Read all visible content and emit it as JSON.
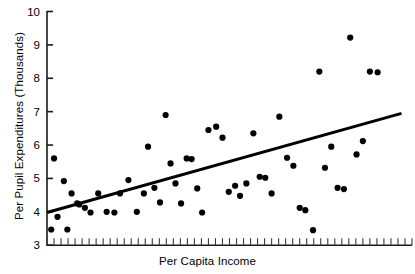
{
  "chart_data": {
    "type": "scatter",
    "title": "",
    "xlabel": "Per Capita Income",
    "ylabel": "Per Pupil Expenditures (Thousands)",
    "ylim": [
      3,
      10
    ],
    "yticks": [
      3,
      4,
      5,
      6,
      7,
      8,
      9,
      10
    ],
    "ytick_labels": [
      "3",
      "4",
      "5",
      "6",
      "7",
      "8",
      "9",
      "10"
    ],
    "xlim": [
      0,
      52
    ],
    "xticks_count": 52,
    "xtick_labels": [],
    "grid": false,
    "legend": null,
    "marker": "filled-circle",
    "marker_color": "#000000",
    "marker_size_px": 5,
    "points": [
      {
        "x": 0.6,
        "y": 3.47
      },
      {
        "x": 1.0,
        "y": 5.6
      },
      {
        "x": 1.5,
        "y": 3.85
      },
      {
        "x": 2.4,
        "y": 4.92
      },
      {
        "x": 2.9,
        "y": 3.47
      },
      {
        "x": 3.5,
        "y": 4.55
      },
      {
        "x": 4.3,
        "y": 4.25
      },
      {
        "x": 4.6,
        "y": 4.22
      },
      {
        "x": 5.4,
        "y": 4.12
      },
      {
        "x": 6.2,
        "y": 3.98
      },
      {
        "x": 7.3,
        "y": 4.55
      },
      {
        "x": 8.5,
        "y": 4.0
      },
      {
        "x": 9.6,
        "y": 3.98
      },
      {
        "x": 10.4,
        "y": 4.55
      },
      {
        "x": 11.6,
        "y": 4.95
      },
      {
        "x": 12.8,
        "y": 4.0
      },
      {
        "x": 13.8,
        "y": 4.55
      },
      {
        "x": 14.4,
        "y": 5.95
      },
      {
        "x": 15.3,
        "y": 4.72
      },
      {
        "x": 16.1,
        "y": 4.28
      },
      {
        "x": 16.9,
        "y": 6.9
      },
      {
        "x": 17.6,
        "y": 5.45
      },
      {
        "x": 18.3,
        "y": 4.85
      },
      {
        "x": 19.1,
        "y": 4.25
      },
      {
        "x": 19.9,
        "y": 5.6
      },
      {
        "x": 20.6,
        "y": 5.58
      },
      {
        "x": 21.4,
        "y": 4.7
      },
      {
        "x": 22.1,
        "y": 3.98
      },
      {
        "x": 23.0,
        "y": 6.45
      },
      {
        "x": 24.1,
        "y": 6.55
      },
      {
        "x": 25.0,
        "y": 6.22
      },
      {
        "x": 25.9,
        "y": 4.6
      },
      {
        "x": 26.8,
        "y": 4.78
      },
      {
        "x": 27.5,
        "y": 4.48
      },
      {
        "x": 28.4,
        "y": 4.85
      },
      {
        "x": 29.4,
        "y": 6.35
      },
      {
        "x": 30.3,
        "y": 5.05
      },
      {
        "x": 31.1,
        "y": 5.02
      },
      {
        "x": 32.0,
        "y": 4.55
      },
      {
        "x": 33.1,
        "y": 6.85
      },
      {
        "x": 34.2,
        "y": 5.62
      },
      {
        "x": 35.1,
        "y": 5.38
      },
      {
        "x": 36.0,
        "y": 4.12
      },
      {
        "x": 36.8,
        "y": 4.05
      },
      {
        "x": 37.9,
        "y": 3.45
      },
      {
        "x": 38.8,
        "y": 8.2
      },
      {
        "x": 39.6,
        "y": 5.32
      },
      {
        "x": 40.5,
        "y": 5.95
      },
      {
        "x": 41.4,
        "y": 4.72
      },
      {
        "x": 42.3,
        "y": 4.68
      },
      {
        "x": 43.2,
        "y": 9.22
      },
      {
        "x": 44.1,
        "y": 5.72
      },
      {
        "x": 45.0,
        "y": 6.12
      },
      {
        "x": 46.0,
        "y": 8.2
      },
      {
        "x": 47.1,
        "y": 8.18
      }
    ],
    "trend_line": {
      "type": "linear-fit",
      "x_start": 0.0,
      "y_start": 3.98,
      "x_end": 50.5,
      "y_end": 6.95,
      "color": "#000000",
      "width_px": 3
    }
  }
}
